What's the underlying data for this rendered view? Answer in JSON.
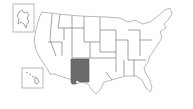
{
  "map": {
    "title": "United States",
    "highlighted_state": "New Mexico",
    "highlight_color": "#6b6b6b",
    "base_fill": "#ffffff",
    "border_color": "#8a8a8a",
    "insets": [
      "Alaska",
      "Hawaii"
    ]
  }
}
